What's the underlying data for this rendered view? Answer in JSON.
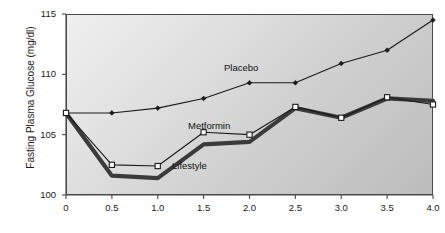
{
  "chart_data": {
    "type": "line",
    "title": "",
    "xlabel": "",
    "ylabel": "Fasting Plasma Glucose (mg/dl)",
    "x": [
      0,
      0.5,
      1.0,
      1.5,
      2.0,
      2.5,
      3.0,
      3.5,
      4.0
    ],
    "xtick_labels": [
      "0",
      "0.5",
      "1.0",
      "1.5",
      "2.0",
      "2.5",
      "3.0",
      "3.5",
      "4.0"
    ],
    "ytick_labels": [
      "100",
      "105",
      "110",
      "115"
    ],
    "yticks": [
      100,
      105,
      110,
      115
    ],
    "xlim": [
      0,
      4.0
    ],
    "ylim": [
      100,
      115
    ],
    "grid": false,
    "legend_position": "inline-annotations",
    "series": [
      {
        "name": "Placebo",
        "values": [
          106.8,
          106.8,
          107.2,
          108.0,
          109.3,
          109.3,
          110.9,
          112.0,
          114.5
        ],
        "marker": "filled-diamond",
        "color": "#1a1a1a",
        "line_width": 1.1,
        "label": "Placebo",
        "label_x": 224,
        "label_y": 62
      },
      {
        "name": "Metformin",
        "values": [
          106.8,
          102.5,
          102.4,
          105.2,
          105.0,
          107.3,
          106.4,
          108.1,
          107.5
        ],
        "marker": "open-square",
        "color": "#1a1a1a",
        "line_width": 1.1,
        "label": "Metformin",
        "label_x": 188,
        "label_y": 120
      },
      {
        "name": "Lifestyle",
        "values": [
          106.8,
          101.6,
          101.4,
          104.2,
          104.4,
          107.2,
          106.4,
          108.0,
          107.8
        ],
        "marker": "none",
        "color": "#3b3b3b",
        "line_width": 4.2,
        "label": "Lifestyle",
        "label_x": 172,
        "label_y": 160
      }
    ],
    "colors": {
      "axis": "#4a4a4a",
      "text": "#1a1a1a",
      "plot_bg_light": "#efefef",
      "plot_bg_dark": "#bcbcbc",
      "placebo": "#1a1a1a",
      "metformin": "#1a1a1a",
      "lifestyle": "#3b3b3b"
    }
  }
}
